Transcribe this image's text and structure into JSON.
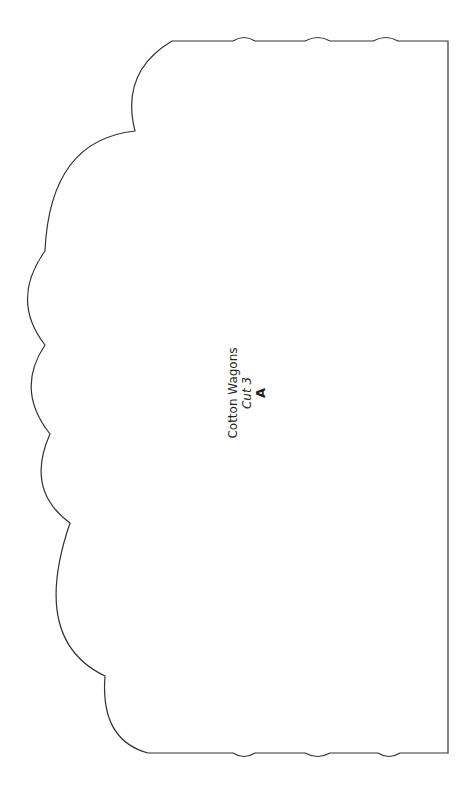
{
  "pattern": {
    "title": "Cotton Wagons",
    "instruction": "Cut 3",
    "piece_letter": "A",
    "stroke_color": "#333333"
  }
}
